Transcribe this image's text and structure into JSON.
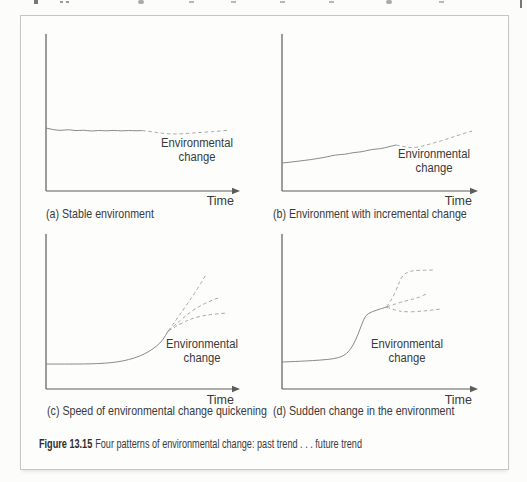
{
  "colors": {
    "axis": "#5c5c5c",
    "past_line": "#8a8a8a",
    "future_line": "#a6a6a6",
    "text": "#3a3a3a",
    "box_border": "#c6c6c3",
    "background": "#fdfdfc"
  },
  "figure_caption": {
    "number": "Figure 13.15",
    "text": "Four patterns of environmental change: past trend . . . future trend"
  },
  "chart_data": [
    {
      "id": "a",
      "type": "line",
      "caption": "(a) Stable environment",
      "xlabel": "Time",
      "annotation": "Environmental change",
      "axis_range": {
        "x": [
          0,
          100
        ],
        "y": [
          0,
          100
        ]
      },
      "series": [
        {
          "name": "past trend",
          "style": "solid",
          "points": [
            [
              0,
              40.1
            ],
            [
              4,
              39.0
            ],
            [
              8,
              38.5
            ],
            [
              12,
              39.2
            ],
            [
              16,
              38.3
            ],
            [
              20,
              38.9
            ],
            [
              24,
              38.0
            ],
            [
              28,
              38.7
            ],
            [
              32,
              38.2
            ],
            [
              36,
              38.7
            ],
            [
              40,
              38.2
            ],
            [
              44,
              38.6
            ],
            [
              48,
              38.3
            ],
            [
              51,
              38.5
            ]
          ]
        },
        {
          "name": "future trend",
          "style": "dashed",
          "points": [
            [
              51,
              38.5
            ],
            [
              56,
              37.8
            ],
            [
              61,
              36.9
            ],
            [
              66,
              36.3
            ],
            [
              71,
              36.3
            ],
            [
              76,
              36.8
            ],
            [
              81,
              37.2
            ],
            [
              86,
              37.6
            ],
            [
              91,
              38.0
            ],
            [
              97,
              38.7
            ]
          ]
        }
      ]
    },
    {
      "id": "b",
      "type": "line",
      "caption": "(b) Environment with incremental change",
      "xlabel": "Time",
      "annotation": "Environmental change",
      "axis_range": {
        "x": [
          0,
          100
        ],
        "y": [
          0,
          100
        ]
      },
      "series": [
        {
          "name": "past trend",
          "style": "solid",
          "points": [
            [
              0,
              17.8
            ],
            [
              6,
              18.6
            ],
            [
              12,
              19.5
            ],
            [
              18,
              20.5
            ],
            [
              24,
              21.8
            ],
            [
              28,
              23.0
            ],
            [
              33,
              23.3
            ],
            [
              38,
              24.6
            ],
            [
              42,
              24.9
            ],
            [
              47,
              26.5
            ],
            [
              52,
              26.9
            ],
            [
              56,
              28.1
            ],
            [
              60,
              29.3
            ]
          ]
        },
        {
          "name": "future trend",
          "style": "dashed",
          "points": [
            [
              60,
              29.3
            ],
            [
              64,
              28.3
            ],
            [
              69,
              27.4
            ],
            [
              75,
              28.9
            ],
            [
              81,
              31.0
            ],
            [
              87,
              33.2
            ],
            [
              93,
              35.6
            ],
            [
              100,
              38.2
            ]
          ]
        }
      ]
    },
    {
      "id": "c",
      "type": "line",
      "caption": "(c) Speed of environmental change quickening",
      "xlabel": "Time",
      "annotation": "Environmental change",
      "axis_range": {
        "x": [
          0,
          100
        ],
        "y": [
          0,
          100
        ]
      },
      "series": [
        {
          "name": "past trend",
          "style": "solid",
          "points": [
            [
              0,
              16.1
            ],
            [
              8,
              16.1
            ],
            [
              16,
              16.1
            ],
            [
              24,
              16.2
            ],
            [
              31,
              16.6
            ],
            [
              38,
              17.4
            ],
            [
              44,
              18.9
            ],
            [
              50,
              21.2
            ],
            [
              55,
              24.3
            ],
            [
              59,
              27.8
            ],
            [
              62,
              31.4
            ],
            [
              65,
              37.4
            ]
          ]
        },
        {
          "name": "future trend (high)",
          "style": "dashed",
          "points": [
            [
              65,
              37.4
            ],
            [
              70,
              45.9
            ],
            [
              75,
              54.6
            ],
            [
              80,
              63.5
            ],
            [
              85,
              73.5
            ]
          ]
        },
        {
          "name": "future trend (mid)",
          "style": "dashed",
          "points": [
            [
              65,
              37.4
            ],
            [
              72,
              45.0
            ],
            [
              79,
              51.6
            ],
            [
              86,
              56.2
            ],
            [
              93,
              59.4
            ]
          ]
        },
        {
          "name": "future trend (low)",
          "style": "dashed",
          "points": [
            [
              65,
              37.4
            ],
            [
              72,
              42.6
            ],
            [
              79,
              46.1
            ],
            [
              87,
              48.1
            ],
            [
              96,
              49.0
            ]
          ]
        }
      ]
    },
    {
      "id": "d",
      "type": "line",
      "caption": "(d) Sudden change in the environment",
      "xlabel": "Time",
      "annotation": "Environmental change",
      "axis_range": {
        "x": [
          0,
          100
        ],
        "y": [
          0,
          100
        ]
      },
      "series": [
        {
          "name": "past trend",
          "style": "solid",
          "points": [
            [
              0,
              17.4
            ],
            [
              8,
              17.8
            ],
            [
              16,
              18.3
            ],
            [
              24,
              19.0
            ],
            [
              30,
              20.1
            ],
            [
              34,
              22.6
            ],
            [
              37,
              27.1
            ],
            [
              40,
              35.0
            ],
            [
              43,
              45.2
            ],
            [
              45,
              48.7
            ],
            [
              50,
              51.0
            ],
            [
              55,
              52.9
            ]
          ]
        },
        {
          "name": "future trend (high)",
          "style": "dashed",
          "points": [
            [
              55,
              52.9
            ],
            [
              58,
              58.1
            ],
            [
              61,
              66.5
            ],
            [
              63,
              72.6
            ],
            [
              66,
              75.5
            ],
            [
              70,
              76.5
            ],
            [
              75,
              76.6
            ],
            [
              80,
              76.8
            ]
          ]
        },
        {
          "name": "future trend (mid)",
          "style": "dashed",
          "points": [
            [
              55,
              52.9
            ],
            [
              61,
              55.5
            ],
            [
              67,
              57.4
            ],
            [
              72,
              59.0
            ],
            [
              77,
              61.9
            ]
          ]
        },
        {
          "name": "future trend (low)",
          "style": "dashed",
          "points": [
            [
              55,
              52.9
            ],
            [
              60,
              50.6
            ],
            [
              65,
              49.7
            ],
            [
              72,
              50.0
            ],
            [
              78,
              50.8
            ],
            [
              84,
              51.6
            ]
          ]
        }
      ]
    }
  ]
}
